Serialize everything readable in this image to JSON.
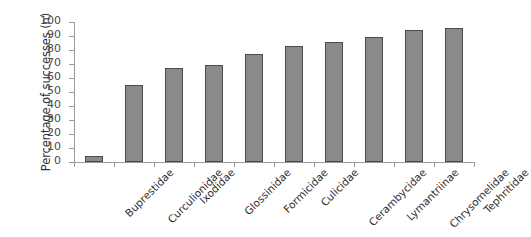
{
  "chart_data": {
    "type": "bar",
    "title": "",
    "xlabel": "",
    "ylabel": "Percentage of successes (n)",
    "ylim": [
      0,
      100
    ],
    "ytick_step": 10,
    "yticks": [
      100,
      90,
      80,
      70,
      60,
      50,
      40,
      30,
      20,
      10,
      0
    ],
    "grid": false,
    "legend": false,
    "bar_color": "#8a8a8a",
    "bar_border_color": "#4b4b4b",
    "axis_color": "#9a9a9a",
    "categories": [
      "Buprestidae",
      "Curculionidae",
      "Ixodidae",
      "Glossinidae",
      "Formicidae",
      "Culicidae",
      "Cerambycidae",
      "Lymantriinae",
      "Chrysomelidae",
      "Tephritidae"
    ],
    "values": [
      4,
      55,
      67,
      69,
      77,
      83,
      86,
      89,
      94,
      96
    ]
  }
}
